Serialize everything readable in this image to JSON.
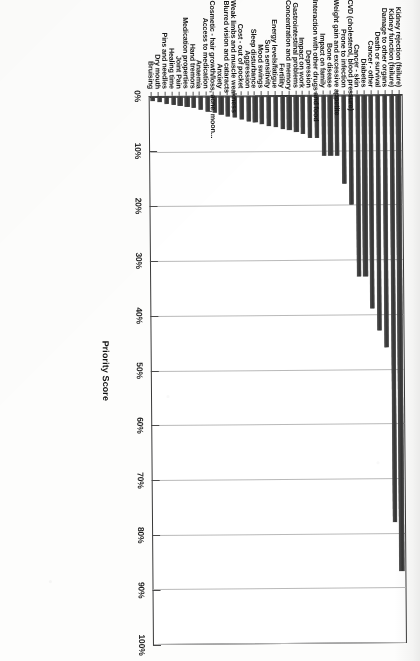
{
  "chart_data": {
    "type": "bar",
    "title": "",
    "subtitle": "",
    "orientation": "vertical-columns-rotated",
    "xlabel": "",
    "ylabel": "Priority Score",
    "ylim": [
      0,
      100
    ],
    "grid": true,
    "legend": false,
    "legend_position": "none",
    "value_unit": "%",
    "axis_ticks": [
      "0%",
      "10%",
      "20%",
      "30%",
      "40%",
      "50%",
      "60%",
      "70%",
      "80%",
      "90%",
      "100%"
    ],
    "axis_tick_values": [
      0,
      10,
      20,
      30,
      40,
      50,
      60,
      70,
      80,
      90,
      100
    ],
    "categories": [
      "Kidney rejection (failure)",
      "Kidney function (failure)",
      "Damage to other organs",
      "Death or survival",
      "Cancer - other",
      "Diabetes",
      "Cancer - skin",
      "CVD (cholesterol, blood pressure)",
      "Prone to infection",
      "Weight gain and excessive appetite",
      "Bone disease",
      "Impact on family",
      "Interaction with other drugs and food",
      "Depression",
      "Impact on work",
      "Gastrointestinal problems",
      "Concentration and memory",
      "Fertility",
      "Energy levels/fatigue",
      "Sun sensitivity",
      "Mood swings",
      "Sleep disturbance",
      "Aggression",
      "Cost - out of pocket",
      "Weak limbs and muscle weakness",
      "Blurred vision and cataracts",
      "Anxiety",
      "Cosmetic - hair growth/loss, acne, moon...",
      "Access to medication",
      "Anaemia",
      "Hand tremors",
      "Medication properties",
      "Joint Pain",
      "Healing time",
      "Pins and needles",
      "Dry mouth",
      "Bruising"
    ],
    "values": [
      87,
      78,
      46,
      43,
      39,
      33,
      33,
      20,
      16,
      11,
      11,
      11,
      7.7,
      7.7,
      7.0,
      6.6,
      6.3,
      6.0,
      5.7,
      5.4,
      5.1,
      4.8,
      4.5,
      4.2,
      3.9,
      3.6,
      3.3,
      3.0,
      2.7,
      2.4,
      2.1,
      1.9,
      1.7,
      1.5,
      1.2,
      1.0,
      0.8
    ],
    "series": [
      {
        "name": "Priority Score",
        "values": [
          87,
          78,
          46,
          43,
          39,
          33,
          33,
          20,
          16,
          11,
          11,
          11,
          7.7,
          7.7,
          7.0,
          6.6,
          6.3,
          6.0,
          5.7,
          5.4,
          5.1,
          4.8,
          4.5,
          4.2,
          3.9,
          3.6,
          3.3,
          3.0,
          2.7,
          2.4,
          2.1,
          1.9,
          1.7,
          1.5,
          1.2,
          1.0,
          0.8
        ]
      }
    ],
    "colors": {
      "bar": "#3f3f3f",
      "gridline": "#b9b9b9",
      "axis": "#3a3a3a",
      "text": "#141414",
      "background": "#ffffff"
    }
  }
}
